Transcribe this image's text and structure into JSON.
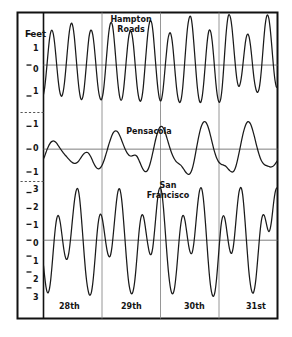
{
  "chart_data": {
    "type": "line",
    "title": "",
    "subtitle": "",
    "xlabel": "",
    "ylabel": "Feet",
    "grid": true,
    "legend_position": "inline-annotations",
    "axis_unit": "Feet",
    "x": {
      "tick_labels": [
        "28th",
        "29th",
        "30th",
        "31st"
      ],
      "range_days": 4,
      "divider_positions_days": [
        0,
        1,
        2,
        3,
        4
      ],
      "note": "four successive days of tide height"
    },
    "panels": [
      {
        "name": "Hampton Roads",
        "label": "Hampton\nRoads",
        "tide_type": "semidiurnal",
        "ytick_labels": [
          "1",
          "0",
          "1"
        ],
        "ytick_values": [
          1,
          0,
          -1
        ],
        "ylim": [
          -1.55,
          1.65
        ],
        "zero_line": 0,
        "samples_per_day": 48,
        "values": [
          -0.95,
          -0.72,
          -0.35,
          0.08,
          0.52,
          0.88,
          1.08,
          1.12,
          1.0,
          0.72,
          0.32,
          -0.12,
          -0.52,
          -0.82,
          -0.98,
          -1.0,
          -0.86,
          -0.58,
          -0.18,
          0.28,
          0.72,
          1.08,
          1.3,
          1.35,
          1.22,
          0.92,
          0.48,
          0.0,
          -0.45,
          -0.82,
          -1.05,
          -1.12,
          -1.02,
          -0.76,
          -0.36,
          0.1,
          0.55,
          0.92,
          1.1,
          1.12,
          0.98,
          0.68,
          0.26,
          -0.2,
          -0.62,
          -0.92,
          -1.08,
          -1.12,
          -1.0,
          -0.72,
          -0.3,
          0.18,
          0.65,
          1.05,
          1.3,
          1.38,
          1.28,
          0.98,
          0.54,
          0.05,
          -0.42,
          -0.8,
          -1.05,
          -1.14,
          -1.06,
          -0.8,
          -0.4,
          0.06,
          0.5,
          0.86,
          1.06,
          1.1,
          0.96,
          0.66,
          0.22,
          -0.25,
          -0.68,
          -0.98,
          -1.14,
          -1.16,
          -1.02,
          -0.72,
          -0.26,
          0.24,
          0.72,
          1.12,
          1.36,
          1.44,
          1.34,
          1.04,
          0.58,
          0.08,
          -0.4,
          -0.8,
          -1.06,
          -1.16,
          -1.08,
          -0.82,
          -0.42,
          0.04,
          0.46,
          0.82,
          1.0,
          1.04,
          0.9,
          0.6,
          0.16,
          -0.3,
          -0.72,
          -1.02,
          -1.18,
          -1.2,
          -1.06,
          -0.74,
          -0.26,
          0.28,
          0.8,
          1.22,
          1.48,
          1.58,
          1.5,
          1.2,
          0.74,
          0.22,
          -0.3,
          -0.75,
          -1.05,
          -1.2,
          -1.18,
          -0.98,
          -0.62,
          -0.15,
          0.35,
          0.78,
          1.06,
          1.14,
          1.04,
          0.76,
          0.34,
          -0.14,
          -0.6,
          -0.95,
          -1.15,
          -1.2,
          -1.08,
          -0.76,
          -0.26,
          0.32,
          0.88,
          1.32,
          1.58,
          1.62,
          1.5,
          1.22,
          0.8,
          0.34,
          -0.1,
          -0.45,
          -0.65,
          -0.68,
          -0.55,
          -0.3,
          0.05,
          0.42,
          0.75,
          0.95,
          1.0,
          0.9,
          0.65,
          0.3,
          -0.1,
          -0.45,
          -0.7,
          -0.85,
          -0.88,
          -0.78,
          -0.52,
          -0.12,
          0.38,
          0.88,
          1.3,
          1.55,
          1.62,
          1.5,
          1.2,
          0.78,
          0.3,
          -0.15,
          -0.5,
          -0.7,
          -0.72
        ]
      },
      {
        "name": "Pensacola",
        "label": "Pensacola",
        "tide_type": "diurnal",
        "ytick_labels": [
          "1",
          "0",
          "1"
        ],
        "ytick_values": [
          1,
          0,
          -1
        ],
        "ylim": [
          -1.35,
          1.45
        ],
        "zero_line": 0,
        "samples_per_day": 48,
        "values": [
          -0.42,
          -0.3,
          -0.15,
          0.0,
          0.12,
          0.22,
          0.3,
          0.34,
          0.36,
          0.34,
          0.3,
          0.24,
          0.16,
          0.08,
          0.0,
          -0.08,
          -0.15,
          -0.22,
          -0.28,
          -0.34,
          -0.4,
          -0.46,
          -0.52,
          -0.56,
          -0.6,
          -0.62,
          -0.62,
          -0.6,
          -0.56,
          -0.5,
          -0.42,
          -0.34,
          -0.26,
          -0.2,
          -0.16,
          -0.14,
          -0.15,
          -0.2,
          -0.28,
          -0.38,
          -0.5,
          -0.62,
          -0.72,
          -0.8,
          -0.85,
          -0.86,
          -0.84,
          -0.78,
          -0.68,
          -0.55,
          -0.4,
          -0.22,
          -0.04,
          0.15,
          0.32,
          0.48,
          0.62,
          0.72,
          0.78,
          0.8,
          0.78,
          0.72,
          0.62,
          0.5,
          0.36,
          0.22,
          0.08,
          -0.04,
          -0.14,
          -0.22,
          -0.28,
          -0.3,
          -0.3,
          -0.28,
          -0.26,
          -0.26,
          -0.3,
          -0.38,
          -0.5,
          -0.62,
          -0.75,
          -0.86,
          -0.94,
          -0.98,
          -0.98,
          -0.92,
          -0.8,
          -0.64,
          -0.44,
          -0.2,
          0.05,
          0.3,
          0.52,
          0.72,
          0.86,
          0.96,
          1.0,
          0.98,
          0.9,
          0.78,
          0.62,
          0.44,
          0.26,
          0.08,
          -0.08,
          -0.22,
          -0.34,
          -0.44,
          -0.52,
          -0.58,
          -0.62,
          -0.66,
          -0.7,
          -0.76,
          -0.84,
          -0.92,
          -1.0,
          -1.06,
          -1.1,
          -1.1,
          -1.04,
          -0.92,
          -0.74,
          -0.5,
          -0.22,
          0.08,
          0.36,
          0.62,
          0.85,
          1.02,
          1.14,
          1.2,
          1.2,
          1.14,
          1.02,
          0.86,
          0.66,
          0.44,
          0.22,
          0.0,
          -0.18,
          -0.34,
          -0.46,
          -0.56,
          -0.62,
          -0.66,
          -0.68,
          -0.7,
          -0.72,
          -0.76,
          -0.82,
          -0.88,
          -0.94,
          -0.98,
          -1.0,
          -0.98,
          -0.9,
          -0.76,
          -0.56,
          -0.32,
          -0.06,
          0.2,
          0.46,
          0.7,
          0.9,
          1.06,
          1.16,
          1.2,
          1.18,
          1.1,
          0.96,
          0.78,
          0.58,
          0.36,
          0.14,
          -0.06,
          -0.24,
          -0.4,
          -0.52,
          -0.6,
          -0.66,
          -0.7,
          -0.72,
          -0.74,
          -0.76,
          -0.78,
          -0.78,
          -0.76,
          -0.72,
          -0.66,
          -0.58,
          -0.5
        ]
      },
      {
        "name": "San Francisco",
        "label": "San\nFrancisco",
        "tide_type": "mixed semidiurnal",
        "ytick_labels": [
          "3",
          "2",
          "1",
          "0",
          "1",
          "2",
          "3"
        ],
        "ytick_values": [
          3,
          2,
          1,
          0,
          -1,
          -2,
          -3
        ],
        "ylim": [
          -3.7,
          3.6
        ],
        "zero_line": 0,
        "samples_per_day": 48,
        "values": [
          -1.6,
          -2.3,
          -2.9,
          -3.25,
          -3.3,
          -3.05,
          -2.5,
          -1.7,
          -0.8,
          0.1,
          0.85,
          1.35,
          1.55,
          1.45,
          1.1,
          0.55,
          -0.05,
          -0.6,
          -1.0,
          -1.2,
          -1.15,
          -0.85,
          -0.3,
          0.4,
          1.2,
          1.95,
          2.6,
          3.05,
          3.25,
          3.15,
          2.7,
          1.95,
          1.0,
          0.0,
          -1.0,
          -1.9,
          -2.6,
          -3.1,
          -3.4,
          -3.45,
          -3.25,
          -2.75,
          -2.0,
          -1.1,
          -0.15,
          0.7,
          1.3,
          1.6,
          1.6,
          1.35,
          0.9,
          0.35,
          -0.2,
          -0.65,
          -0.95,
          -1.05,
          -0.9,
          -0.45,
          0.25,
          1.05,
          1.85,
          2.55,
          3.05,
          3.25,
          3.1,
          2.65,
          1.9,
          0.95,
          -0.05,
          -1.05,
          -1.95,
          -2.65,
          -3.1,
          -3.35,
          -3.35,
          -3.1,
          -2.6,
          -1.85,
          -0.95,
          0.0,
          0.8,
          1.35,
          1.6,
          1.55,
          1.25,
          0.75,
          0.2,
          -0.3,
          -0.7,
          -0.9,
          -0.85,
          -0.5,
          0.15,
          0.95,
          1.8,
          2.55,
          3.1,
          3.3,
          3.2,
          2.75,
          2.0,
          1.05,
          0.0,
          -1.0,
          -1.9,
          -2.6,
          -3.1,
          -3.35,
          -3.35,
          -3.1,
          -2.55,
          -1.8,
          -0.9,
          0.0,
          0.75,
          1.3,
          1.55,
          1.5,
          1.2,
          0.7,
          0.15,
          -0.35,
          -0.7,
          -0.85,
          -0.75,
          -0.35,
          0.3,
          1.1,
          1.9,
          2.6,
          3.1,
          3.3,
          3.2,
          2.75,
          2.0,
          1.05,
          0.0,
          -1.05,
          -2.0,
          -2.75,
          -3.25,
          -3.5,
          -3.5,
          -3.2,
          -2.6,
          -1.75,
          -0.8,
          0.15,
          0.95,
          1.4,
          1.55,
          1.4,
          1.0,
          0.45,
          -0.1,
          -0.55,
          -0.8,
          -0.8,
          -0.5,
          0.1,
          0.9,
          1.75,
          2.5,
          3.05,
          3.3,
          3.25,
          2.85,
          2.1,
          1.15,
          0.1,
          -0.9,
          -1.85,
          -2.55,
          -3.05,
          -3.3,
          -3.3,
          -3.0,
          -2.45,
          -1.65,
          -0.75,
          0.15,
          0.9,
          1.4,
          1.6,
          1.55,
          1.3,
          0.95,
          0.65,
          0.55,
          0.75,
          1.2,
          1.85,
          2.5,
          3.0,
          3.25,
          3.3
        ]
      }
    ],
    "annotations": [
      {
        "text": "Feet",
        "role": "y-axis-unit"
      },
      {
        "text": "Hampton Roads",
        "role": "panel-label"
      },
      {
        "text": "Pensacola",
        "role": "panel-label"
      },
      {
        "text": "San Francisco",
        "role": "panel-label"
      }
    ],
    "colors": {
      "curve": "#1a1a1a",
      "frame": "#111111",
      "gridline": "#8a8a8a",
      "zeroline": "#6f6f6f",
      "dashed_separator": "#555555",
      "background": "#ffffff"
    }
  },
  "axis": {
    "unit_label": "Feet"
  },
  "panel_labels": {
    "hampton_line1": "Hampton",
    "hampton_line2": "Roads",
    "pensacola": "Pensacola",
    "sf_line1": "San",
    "sf_line2": "Francisco"
  },
  "day_labels": {
    "d0": "28th",
    "d1": "29th",
    "d2": "30th",
    "d3": "31st"
  },
  "yticks": {
    "p1": [
      "1",
      "0",
      "1"
    ],
    "p2": [
      "1",
      "0",
      "1"
    ],
    "p3": [
      "3",
      "2",
      "1",
      "0",
      "1",
      "2",
      "3"
    ]
  }
}
